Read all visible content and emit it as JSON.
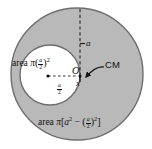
{
  "figure": {
    "background_color": "#ffffff",
    "shaded_color": "#b9b9b9",
    "outline_color": "#6e6e6e",
    "hole_fill_color": "#ffffff",
    "ink_color": "#111111",
    "shapes": {
      "big_circle": {
        "cx": 77,
        "cy": 74,
        "r": 66,
        "fill": "#b9b9b9",
        "stroke": "#6e6e6e"
      },
      "hole_circle": {
        "cx": 50,
        "cy": 75,
        "r": 30,
        "fill": "#ffffff",
        "stroke": "#6e6e6e"
      }
    },
    "labels": {
      "area_small_prefix": "area",
      "area_small_pi": "π",
      "area_small_numerator": "a",
      "area_small_denominator": "2",
      "area_small_exponent": "2",
      "area_big_prefix": "area",
      "area_big_pi": "π",
      "area_big_open": "[",
      "area_big_a": "a",
      "area_big_a_exponent": "2",
      "area_big_minus": "−",
      "area_big_numerator": "a",
      "area_big_denominator": "2",
      "area_big_exponent": "2",
      "area_big_close": "]",
      "center_of_mass": "CM",
      "radius_a": "a",
      "offset_numerator": "a",
      "offset_denominator": "2",
      "origin": "O",
      "cm_point": "x"
    },
    "annotations": {
      "vertical_dashed_line": "radius from center O to top of large circle, length a",
      "horizontal_dashed_line": "distance from hole center to O, length a/2",
      "cm_arrow": "curved arrow from CM text to the center-of-mass point x"
    }
  }
}
